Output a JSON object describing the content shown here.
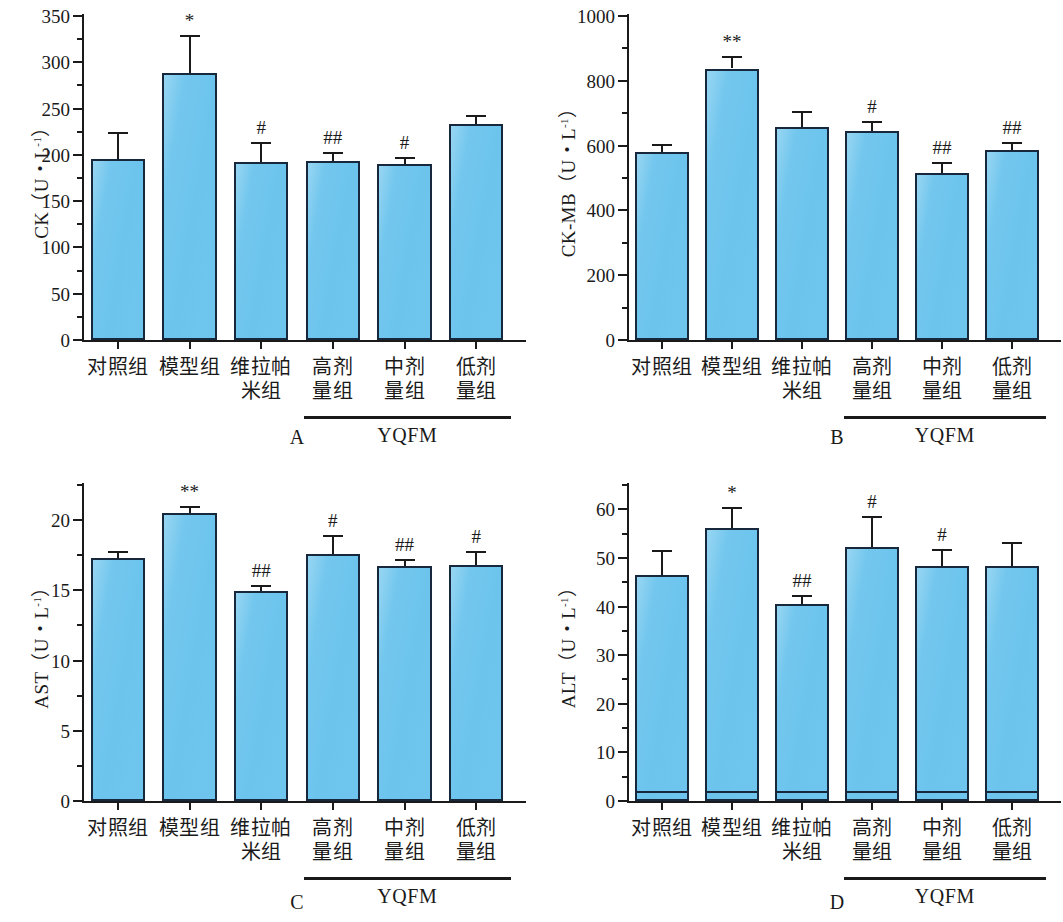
{
  "figure": {
    "background": "#ffffff",
    "bar_fill": "#6cc4ed",
    "bar_stroke": "#17283c",
    "axis_color": "#1a1a1a",
    "categories": [
      {
        "l1": "对照组",
        "l2": ""
      },
      {
        "l1": "模型组",
        "l2": ""
      },
      {
        "l1": "维拉帕",
        "l2": "米组"
      },
      {
        "l1": "高剂",
        "l2": "量组"
      },
      {
        "l1": "中剂",
        "l2": "量组"
      },
      {
        "l1": "低剂",
        "l2": "量组"
      }
    ],
    "group_bracket_label": "YQFM",
    "group_bracket_span": [
      3,
      5
    ]
  },
  "chart_data": [
    {
      "type": "bar",
      "panel": "A",
      "panel_letter": "A",
      "title": "",
      "ylabel_text": "CK（U・L",
      "ylabel_sup": "-1",
      "ylabel_tail": "）",
      "xlabel": "",
      "categories": [
        "对照组",
        "模型组",
        "维拉帕米组",
        "高剂量组",
        "中剂量组",
        "低剂量组"
      ],
      "values": [
        196,
        288,
        192,
        193,
        190,
        233
      ],
      "errors": [
        29,
        42,
        22,
        10,
        8,
        10
      ],
      "annotations": [
        "",
        "*",
        "#",
        "##",
        "#",
        ""
      ],
      "ylim": [
        0,
        350
      ],
      "yticks": [
        0,
        50,
        100,
        150,
        200,
        250,
        300,
        350
      ],
      "ytick_labels": [
        "0",
        "50",
        "100",
        "150",
        "200",
        "250",
        "300",
        "350"
      ],
      "minor_tick_step": 25,
      "grid": false,
      "legend": "none"
    },
    {
      "type": "bar",
      "panel": "B",
      "panel_letter": "B",
      "title": "",
      "ylabel_text": "CK-MB（U・L",
      "ylabel_sup": "-1",
      "ylabel_tail": "）",
      "xlabel": "",
      "categories": [
        "对照组",
        "模型组",
        "维拉帕米组",
        "高剂量组",
        "中剂量组",
        "低剂量组"
      ],
      "values": [
        581,
        838,
        657,
        646,
        515,
        587
      ],
      "errors": [
        24,
        39,
        50,
        30,
        34,
        23
      ],
      "annotations": [
        "",
        "**",
        "",
        "#",
        "##",
        "##"
      ],
      "ylim": [
        0,
        1000
      ],
      "yticks": [
        0,
        200,
        400,
        600,
        800,
        1000
      ],
      "ytick_labels": [
        "0",
        "200",
        "400",
        "600",
        "800",
        "1000"
      ],
      "minor_tick_step": 100,
      "grid": false,
      "legend": "none"
    },
    {
      "type": "bar",
      "panel": "C",
      "panel_letter": "C",
      "title": "",
      "ylabel_text": "AST（U・L",
      "ylabel_sup": "-1",
      "ylabel_tail": "）",
      "xlabel": "",
      "categories": [
        "对照组",
        "模型组",
        "维拉帕米组",
        "高剂量组",
        "中剂量组",
        "低剂量组"
      ],
      "values": [
        17.3,
        20.5,
        14.95,
        17.6,
        16.75,
        16.8
      ],
      "errors": [
        0.5,
        0.5,
        0.45,
        1.35,
        0.45,
        1.0
      ],
      "annotations": [
        "",
        "**",
        "##",
        "#",
        "##",
        "#"
      ],
      "ylim": [
        0,
        22.5
      ],
      "yticks": [
        0,
        5,
        10,
        15,
        20
      ],
      "ytick_labels": [
        "0",
        "5",
        "10",
        "15",
        "20"
      ],
      "minor_tick_step": 2.5,
      "grid": false,
      "legend": "none"
    },
    {
      "type": "bar",
      "panel": "D",
      "panel_letter": "D",
      "title": "",
      "ylabel_text": "ALT（U・L",
      "ylabel_sup": "-1",
      "ylabel_tail": "）",
      "xlabel": "",
      "categories": [
        "对照组",
        "模型组",
        "维拉帕米组",
        "高剂量组",
        "中剂量组",
        "低剂量组"
      ],
      "values": [
        46.5,
        56.2,
        40.5,
        52.3,
        48.4,
        48.4
      ],
      "errors": [
        5.1,
        4.2,
        1.8,
        6.4,
        3.5,
        4.8
      ],
      "annotations": [
        "",
        "*",
        "##",
        "#",
        "#",
        ""
      ],
      "ylim": [
        0,
        65
      ],
      "yticks": [
        0,
        10,
        20,
        30,
        40,
        50,
        60
      ],
      "ytick_labels": [
        "0",
        "10",
        "20",
        "30",
        "40",
        "50",
        "60"
      ],
      "minor_tick_step": 5,
      "grid": false,
      "legend": "none"
    }
  ]
}
